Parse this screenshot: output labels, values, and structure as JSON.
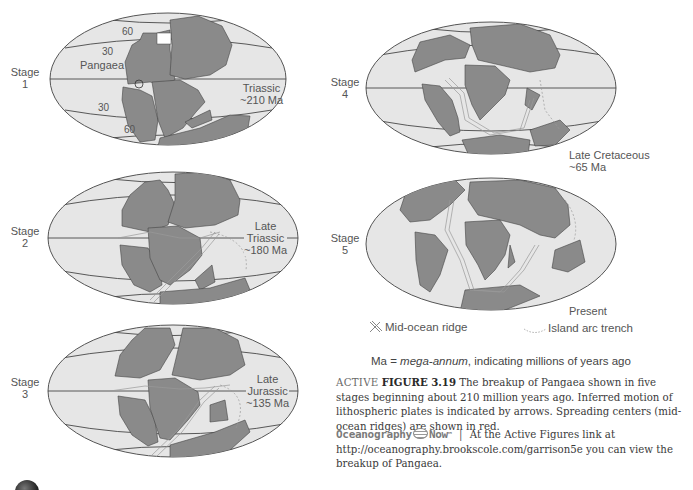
{
  "figure": {
    "stages": [
      {
        "id": 1,
        "label_line1": "Stage",
        "label_line2": "1",
        "era_lines": [
          "Triassic",
          "~210 Ma"
        ],
        "annotations": {
          "supercontinent": "Pangaea",
          "lat_top_60": "60",
          "lat_top_30": "30",
          "lat_bottom_30": "30",
          "lat_bottom_60": "60"
        }
      },
      {
        "id": 2,
        "label_line1": "Stage",
        "label_line2": "2",
        "era_lines": [
          "Late",
          "Triassic",
          "~180 Ma"
        ]
      },
      {
        "id": 3,
        "label_line1": "Stage",
        "label_line2": "3",
        "era_lines": [
          "Late",
          "Jurassic",
          "~135 Ma"
        ]
      },
      {
        "id": 4,
        "label_line1": "Stage",
        "label_line2": "4",
        "era_lines": [
          "Late Cretaceous",
          "~65 Ma"
        ]
      },
      {
        "id": 5,
        "label_line1": "Stage",
        "label_line2": "5",
        "era_lines": [
          "Present"
        ]
      }
    ],
    "legend": {
      "ridge_label": "Mid-ocean ridge",
      "trench_label": "Island arc trench"
    },
    "ma_note": {
      "prefix": "Ma = ",
      "term": "mega-annum",
      "suffix": ", indicating millions of years ago"
    },
    "caption": {
      "active": "ACTIVE",
      "figure_number": "FIGURE 3.19",
      "text": "The breakup of Pangaea shown in five stages beginning about 210 million years ago. Inferred motion of lithospheric plates is indicated by arrows. Spreading centers (mid-ocean ridges) are shown in red."
    },
    "now_line": {
      "brand_left": "Oceanography",
      "brand_right": "Now",
      "tm": "™",
      "separator": "|",
      "text": "At the Active Figures link at http://oceanography.brookscole.com/garrison5e you can view the breakup of Pangaea."
    },
    "colors": {
      "ocean": "#e6e6e6",
      "land": "#8a8a8a",
      "outline": "#555555",
      "grid": "#444444"
    }
  }
}
